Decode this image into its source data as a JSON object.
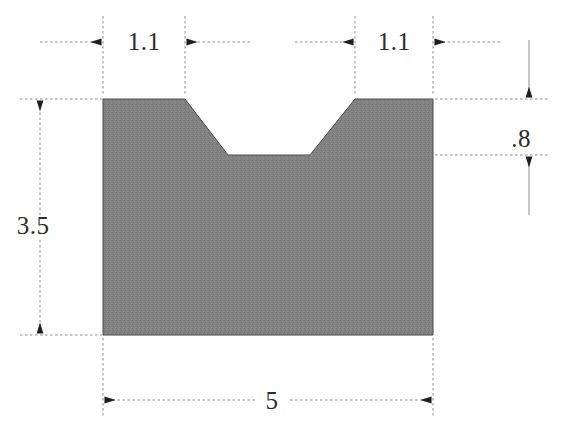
{
  "drawing": {
    "title": "V-notch block dimensioned drawing",
    "units": "",
    "fill_color": "#828282",
    "line_color": "#555555",
    "text_color": "#2b2b2b",
    "background_color": "#ffffff"
  },
  "shape": {
    "name": "v-notch-block",
    "outline_points": "103,99 185,99 228,155 310,155 355,99 433,99 433,335 103,335",
    "left_x": 103,
    "right_x": 433,
    "top_y": 99,
    "bottom_y": 335,
    "notch_top_left_x": 185,
    "notch_top_right_x": 355,
    "notch_bottom_left_x": 228,
    "notch_bottom_right_x": 310,
    "notch_bottom_y": 155
  },
  "dimensions": [
    {
      "id": "width-left-flat",
      "label": "1.1",
      "orientation": "horizontal",
      "position": "top-left",
      "from": 103,
      "to": 185,
      "line_y": 42,
      "text_x": 144,
      "text_y": 50
    },
    {
      "id": "width-right-flat",
      "label": "1.1",
      "orientation": "horizontal",
      "position": "top-right",
      "from": 355,
      "to": 433,
      "line_y": 42,
      "text_x": 394,
      "text_y": 50
    },
    {
      "id": "overall-height",
      "label": "3.5",
      "orientation": "vertical",
      "position": "left",
      "from": 99,
      "to": 335,
      "line_x": 40,
      "text_x": 33,
      "text_y": 234
    },
    {
      "id": "notch-depth",
      "label": ".8",
      "orientation": "vertical",
      "position": "right",
      "from": 99,
      "to": 155,
      "line_x": 529,
      "text_x": 521,
      "text_y": 147
    },
    {
      "id": "overall-width",
      "label": "5",
      "orientation": "horizontal",
      "position": "bottom",
      "from": 103,
      "to": 433,
      "line_y": 400,
      "text_x": 272,
      "text_y": 409
    }
  ]
}
